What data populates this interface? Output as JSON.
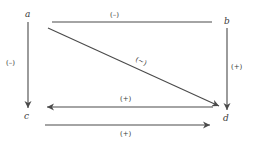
{
  "diagram": {
    "nodes": {
      "a": {
        "label": "a"
      },
      "b": {
        "label": "b"
      },
      "c": {
        "label": "c"
      },
      "d": {
        "label": "d"
      }
    },
    "edges": [
      {
        "from": "a",
        "to": "b",
        "label": "(–)",
        "arrow": "none"
      },
      {
        "from": "a",
        "to": "d",
        "label": "(~)",
        "arrow": "end"
      },
      {
        "from": "a",
        "to": "c",
        "label": "(–)",
        "arrow": "end"
      },
      {
        "from": "b",
        "to": "d",
        "label": "(+)",
        "arrow": "end"
      },
      {
        "from": "d",
        "to": "c",
        "label": "(+)",
        "arrow": "end"
      },
      {
        "from": "c",
        "to": "d",
        "label": "(+)",
        "arrow": "end"
      }
    ],
    "colors": {
      "line": "#4a4a4a",
      "text": "#3a3a3a",
      "background": "#ffffff"
    }
  }
}
